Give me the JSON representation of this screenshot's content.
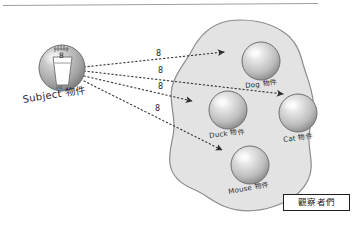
{
  "diagram": {
    "title_rule": "",
    "subject": {
      "label": "Subject 物件",
      "inner_top_label": "8",
      "inner_bottom_label": "int"
    },
    "messages": [
      {
        "label": "8"
      },
      {
        "label": "8"
      },
      {
        "label": "8"
      },
      {
        "label": "8"
      }
    ],
    "observers_group": {
      "box_label": "觀察者們",
      "objects": [
        {
          "name": "dog",
          "label": "Dog 物件"
        },
        {
          "name": "duck",
          "label": "Duck 物件"
        },
        {
          "name": "cat",
          "label": "Cat 物件"
        },
        {
          "name": "mouse",
          "label": "Mouse 物件"
        }
      ]
    },
    "colors": {
      "blob_fill": "#e3e3e3",
      "blob_stroke": "#8c8c8c",
      "sphere_light": "#f2f2f2",
      "sphere_mid": "#c9c9c9",
      "sphere_dark": "#8e8e8e",
      "subject_dark": "#9a9a9a",
      "arrow": "#3a3a3a",
      "text": "#262626",
      "rule": "#9e9e9e"
    }
  }
}
